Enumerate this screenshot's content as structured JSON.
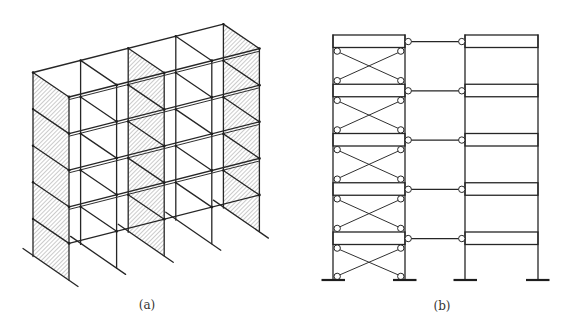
{
  "colors": {
    "line": "#262626",
    "hatch": "#8c8c8c",
    "background": "#ffffff"
  },
  "figures": [
    {
      "id": "a",
      "label": "(a)",
      "kind": "isometric-frame-with-shear-walls",
      "stories": 5,
      "bays": 4,
      "shear_wall_frames": [
        0,
        2,
        4
      ]
    },
    {
      "id": "b",
      "label": "(b)",
      "kind": "braced-frame-linked-to-rigid-frame",
      "stories": 5,
      "towers": 2,
      "braced_tower_index": 0,
      "link_beams": 5
    }
  ]
}
